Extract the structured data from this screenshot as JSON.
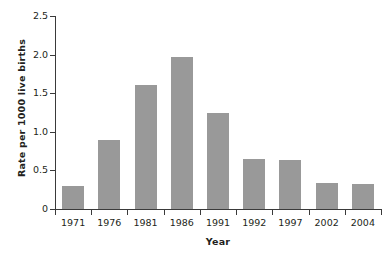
{
  "chart_data": {
    "type": "bar",
    "title": "",
    "subtitle": "",
    "xlabel": "Year",
    "ylabel": "Rate per 1000 live births",
    "categories": [
      "1971",
      "1976",
      "1981",
      "1986",
      "1991",
      "1992",
      "1997",
      "2002",
      "2004"
    ],
    "values": [
      0.3,
      0.9,
      1.6,
      1.97,
      1.25,
      0.65,
      0.63,
      0.34,
      0.33
    ],
    "ylim": [
      0,
      2.5
    ],
    "ytick_values": [
      0,
      0.5,
      1.0,
      1.5,
      2.0,
      2.5
    ],
    "ytick_labels": [
      "0",
      "0.5",
      "1.0",
      "1.5",
      "2.0",
      "2.5"
    ],
    "grid": false,
    "legend": null,
    "bar_color": "#999999",
    "axis_color": "#3a3a3a",
    "text_color": "#231f20",
    "background": "#ffffff"
  }
}
